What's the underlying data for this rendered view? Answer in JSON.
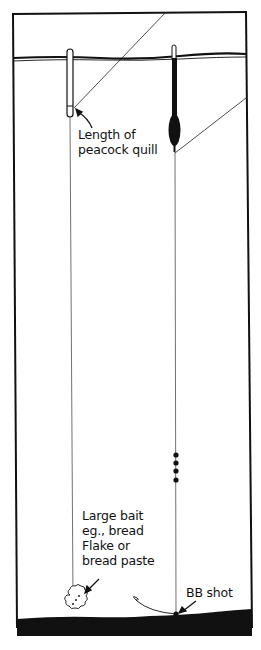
{
  "diagram": {
    "type": "fishing-float-rig-illustration",
    "labels": {
      "quill_line1": "Length of",
      "quill_line2": "peacock quill",
      "bait_line1": "Large bait",
      "bait_line2": "eg., bread",
      "bait_line3": "Flake or",
      "bait_line4": "bread paste",
      "shot": "BB shot"
    },
    "elements": [
      "water-surface-line",
      "peacock-quill-float-left",
      "bodied-waggler-float-right",
      "fishing-line-left",
      "fishing-line-right",
      "split-shot-dots",
      "bb-shot-on-bottom",
      "bread-bait",
      "river-bed",
      "frame-border"
    ],
    "shot_count": 4,
    "colors": {
      "ink": "#111111",
      "background": "#ffffff"
    }
  }
}
